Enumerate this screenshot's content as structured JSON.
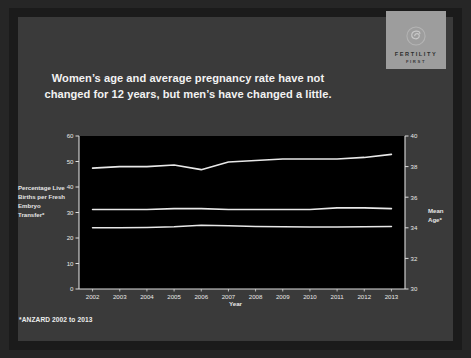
{
  "slide": {
    "title": "Women’s age and average pregnancy rate have not changed for 12 years, but men’s have changed a little.",
    "footnote": "*ANZARD 2002 to 2013",
    "background_color": "#3a3a3a",
    "frame_color": "#1b1b1b"
  },
  "logo": {
    "icon": "spiral-circle-emblem",
    "wordmark": "FERTILITY",
    "submark": "FIRST",
    "box_color": "#9d9d9d",
    "text_color": "#2d2d2d"
  },
  "chart_data": {
    "type": "line",
    "title": "",
    "xlabel": "Year",
    "ylabel": "Percentage Live Births per Fresh Embryo Transfer*",
    "ylabel_right": "Mean Age*",
    "x": [
      2002,
      2003,
      2004,
      2005,
      2006,
      2007,
      2008,
      2009,
      2010,
      2011,
      2012,
      2013
    ],
    "categories": [
      "2002",
      "2003",
      "2004",
      "2005",
      "2006",
      "2007",
      "2008",
      "2009",
      "2010",
      "2011",
      "2012",
      "2013"
    ],
    "ylim": [
      0,
      60
    ],
    "yticks": [
      0,
      10,
      20,
      30,
      40,
      50,
      60
    ],
    "ylim_right": [
      30,
      40
    ],
    "yticks_right": [
      30,
      32,
      34,
      36,
      38,
      40
    ],
    "grid": false,
    "legend_position": "inline-right",
    "plot_background": "#000000",
    "line_color": "#e8e8e8",
    "series": [
      {
        "name": "Men",
        "axis": "right",
        "label": "Men",
        "label_color": "#ffffff",
        "units": "Mean Age (years)",
        "values": [
          37.9,
          38.0,
          38.0,
          38.1,
          37.8,
          38.3,
          38.4,
          38.5,
          38.5,
          38.5,
          38.6,
          38.8
        ]
      },
      {
        "name": "Women",
        "axis": "right",
        "label": "Women",
        "label_color": "#9a9a9a",
        "units": "Mean Age (years)",
        "values": [
          35.2,
          35.2,
          35.2,
          35.25,
          35.25,
          35.2,
          35.2,
          35.2,
          35.2,
          35.3,
          35.3,
          35.25
        ]
      },
      {
        "name": "Percentage Live Births per Fresh Embryo Transfer",
        "axis": "left",
        "label": "",
        "label_color": "#e8e8e8",
        "units": "%",
        "values": [
          24.0,
          24.0,
          24.1,
          24.4,
          25.0,
          24.8,
          24.5,
          24.4,
          24.3,
          24.3,
          24.4,
          24.5
        ]
      }
    ]
  }
}
